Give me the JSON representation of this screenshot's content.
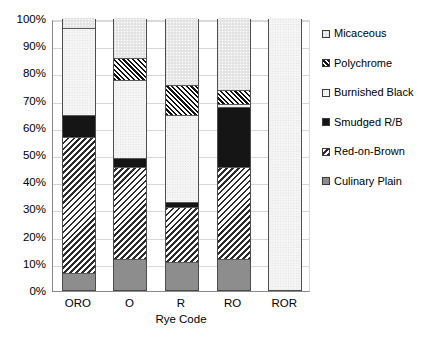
{
  "chart_data": {
    "type": "bar",
    "subtype": "stacked-percentage-column",
    "title": "",
    "xlabel": "Rye Code",
    "ylabel": "",
    "categories": [
      "ORO",
      "O",
      "R",
      "RO",
      "ROR"
    ],
    "ylim": [
      0,
      100
    ],
    "ytick_labels": [
      "0%",
      "10%",
      "20%",
      "30%",
      "40%",
      "50%",
      "60%",
      "70%",
      "80%",
      "90%",
      "100%"
    ],
    "ytick_values": [
      0,
      10,
      20,
      30,
      40,
      50,
      60,
      70,
      80,
      90,
      100
    ],
    "grid": true,
    "legend_position": "right",
    "stack_order_bottom_to_top": [
      "Culinary Plain",
      "Red-on-Brown",
      "Smudged R/B",
      "Burnished Black",
      "Polychrome",
      "Micaceous"
    ],
    "series": [
      {
        "name": "Culinary Plain",
        "pattern": "solid-grey",
        "values": [
          6,
          11,
          10,
          11,
          0
        ]
      },
      {
        "name": "Red-on-Brown",
        "pattern": "diagonal-hatch-back",
        "values": [
          50,
          34,
          20,
          34,
          0
        ]
      },
      {
        "name": "Smudged R/B",
        "pattern": "solid-black",
        "values": [
          8,
          3,
          2,
          22,
          0
        ]
      },
      {
        "name": "Burnished Black",
        "pattern": "light-stipple",
        "values": [
          32,
          29,
          32,
          1,
          100
        ]
      },
      {
        "name": "Polychrome",
        "pattern": "diagonal-hatch-fwd",
        "values": [
          0,
          8,
          11,
          5,
          0
        ]
      },
      {
        "name": "Micaceous",
        "pattern": "light-grey-dots",
        "values": [
          4,
          15,
          25,
          27,
          0
        ]
      }
    ],
    "cumulative_tops": {
      "ORO": [
        6,
        56,
        64,
        96,
        96,
        100
      ],
      "O": [
        11,
        45,
        48,
        77,
        85,
        100
      ],
      "R": [
        10,
        30,
        32,
        64,
        75,
        100
      ],
      "RO": [
        11,
        45,
        67,
        68,
        73,
        100
      ],
      "ROR": [
        0,
        0,
        0,
        100,
        100,
        100
      ]
    }
  },
  "legend": {
    "items": [
      {
        "label": "Micaceous"
      },
      {
        "label": "Polychrome"
      },
      {
        "label": "Burnished Black"
      },
      {
        "label": "Smudged R/B"
      },
      {
        "label": "Red-on-Brown"
      },
      {
        "label": "Culinary Plain"
      }
    ]
  },
  "axis": {
    "x_title": "Rye Code",
    "y_ticks": [
      "100%",
      "90%",
      "80%",
      "70%",
      "60%",
      "50%",
      "40%",
      "30%",
      "20%",
      "10%",
      "0%"
    ],
    "x_ticks": [
      "ORO",
      "O",
      "R",
      "RO",
      "ROR"
    ]
  },
  "colors": {
    "culinary_plain": "#8d8d8d",
    "smudged_rb": "#151515",
    "micaceous": "#e8e8e8",
    "burnished_black": "#f5f5f5",
    "hatch_ink": "#2b2b2b",
    "grid": "#d6d6d6",
    "axis": "#8a8a8a"
  }
}
